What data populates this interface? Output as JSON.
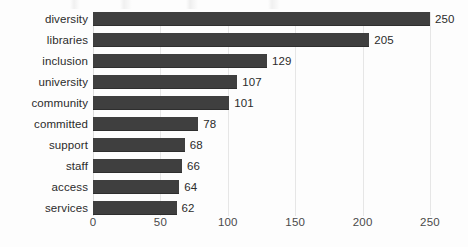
{
  "chart_data": {
    "type": "bar",
    "orientation": "horizontal",
    "title": "",
    "xlabel": "",
    "ylabel": "",
    "xlim": [
      0,
      250
    ],
    "xticks": [
      "0",
      "50",
      "100",
      "150",
      "200",
      "250"
    ],
    "grid": true,
    "legend": false,
    "bar_color": "#3f3f3f",
    "gridline_color": "#e6e6e6",
    "categories": [
      "diversity",
      "libraries",
      "inclusion",
      "university",
      "community",
      "committed",
      "support",
      "staff",
      "access",
      "services"
    ],
    "values": [
      250,
      205,
      129,
      107,
      101,
      78,
      68,
      66,
      64,
      62
    ],
    "value_labels": [
      "250",
      "205",
      "129",
      "107",
      "101",
      "78",
      "68",
      "66",
      "64",
      "62"
    ]
  }
}
